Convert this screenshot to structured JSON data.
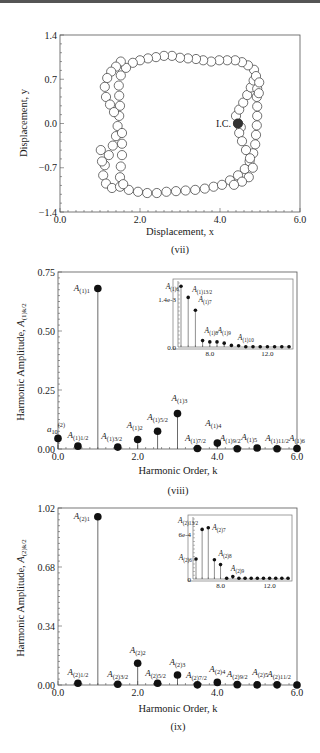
{
  "chart_data": [
    {
      "id": "vii",
      "type": "scatter",
      "title": "",
      "caption": "(vii)",
      "xlabel": "Displacement, x",
      "ylabel": "Displacement, y",
      "xlim": [
        0.0,
        6.0
      ],
      "ylim": [
        -1.4,
        1.4
      ],
      "xticks": [
        "0.0",
        "2.0",
        "4.0",
        "6.0"
      ],
      "yticks": [
        "1.4",
        "0.7",
        "0.0",
        "-0.7",
        "-1.4"
      ],
      "annotation": {
        "text": "I.C.",
        "x": 4.45,
        "y": 0.0
      },
      "initial_condition": {
        "x": 4.45,
        "y": 0.0
      },
      "trajectory": [
        [
          4.45,
          0.0
        ],
        [
          4.4,
          0.12
        ],
        [
          4.48,
          0.22
        ],
        [
          4.58,
          0.33
        ],
        [
          4.68,
          0.45
        ],
        [
          4.77,
          0.57
        ],
        [
          4.84,
          0.68
        ],
        [
          4.93,
          0.55
        ],
        [
          4.92,
          0.42
        ],
        [
          4.85,
          0.85
        ],
        [
          4.7,
          0.92
        ],
        [
          4.55,
          0.97
        ],
        [
          4.38,
          1.0
        ],
        [
          4.18,
          1.0
        ],
        [
          3.98,
          1.0
        ],
        [
          3.78,
          0.98
        ],
        [
          3.58,
          1.0
        ],
        [
          3.4,
          1.02
        ],
        [
          3.2,
          1.03
        ],
        [
          3.0,
          1.04
        ],
        [
          2.8,
          1.07
        ],
        [
          2.6,
          1.07
        ],
        [
          2.4,
          1.05
        ],
        [
          2.2,
          1.03
        ],
        [
          2.0,
          1.0
        ],
        [
          1.82,
          0.96
        ],
        [
          1.65,
          0.88
        ],
        [
          1.52,
          0.76
        ],
        [
          1.47,
          0.6
        ],
        [
          1.48,
          0.44
        ],
        [
          1.5,
          0.28
        ],
        [
          1.48,
          0.12
        ],
        [
          1.44,
          -0.04
        ],
        [
          1.4,
          -0.2
        ],
        [
          1.32,
          -0.35
        ],
        [
          1.22,
          -0.5
        ],
        [
          1.12,
          -0.66
        ],
        [
          1.08,
          -0.82
        ],
        [
          1.15,
          -0.95
        ],
        [
          1.3,
          -1.02
        ],
        [
          1.05,
          -0.6
        ],
        [
          1.02,
          -0.42
        ],
        [
          1.5,
          -1.0
        ],
        [
          1.72,
          -1.05
        ],
        [
          1.95,
          -1.08
        ],
        [
          2.18,
          -1.1
        ],
        [
          2.42,
          -1.1
        ],
        [
          2.66,
          -1.08
        ],
        [
          2.9,
          -1.07
        ],
        [
          3.14,
          -1.06
        ],
        [
          3.38,
          -1.05
        ],
        [
          3.62,
          -1.03
        ],
        [
          3.84,
          -1.0
        ],
        [
          4.05,
          -0.97
        ],
        [
          4.25,
          -0.9
        ],
        [
          4.45,
          -0.82
        ],
        [
          4.62,
          -0.72
        ],
        [
          4.74,
          -0.6
        ],
        [
          4.83,
          -0.47
        ],
        [
          4.88,
          -0.33
        ],
        [
          4.9,
          -0.18
        ],
        [
          4.92,
          -0.03
        ],
        [
          4.93,
          0.12
        ],
        [
          4.93,
          0.27
        ],
        [
          4.52,
          -0.06
        ],
        [
          4.48,
          -0.15
        ],
        [
          4.55,
          -0.28
        ],
        [
          4.65,
          -0.42
        ],
        [
          4.75,
          -0.55
        ],
        [
          4.82,
          -0.7
        ],
        [
          4.72,
          -0.85
        ],
        [
          4.55,
          -0.92
        ],
        [
          4.35,
          -0.97
        ],
        [
          1.52,
          0.98
        ],
        [
          1.4,
          0.9
        ],
        [
          1.28,
          0.82
        ],
        [
          1.18,
          0.72
        ],
        [
          1.12,
          0.58
        ],
        [
          1.15,
          0.42
        ],
        [
          1.25,
          0.3
        ],
        [
          1.35,
          0.18
        ],
        [
          1.55,
          -0.15
        ],
        [
          1.55,
          -0.32
        ],
        [
          1.55,
          -0.5
        ],
        [
          1.52,
          -0.68
        ],
        [
          1.5,
          -0.85
        ],
        [
          1.58,
          -0.96
        ],
        [
          4.9,
          0.75
        ],
        [
          4.98,
          0.65
        ],
        [
          4.97,
          0.48
        ]
      ]
    },
    {
      "id": "viii",
      "type": "bar",
      "subtype": "stem",
      "caption": "(viii)",
      "xlabel": "Harmonic Order, k",
      "ylabel": "Harmonic Amplitude, A(1)k/2",
      "xlim": [
        0.0,
        6.0
      ],
      "ylim": [
        0.0,
        0.75
      ],
      "xticks": [
        "0.0",
        "2.0",
        "4.0",
        "6.0"
      ],
      "yticks": [
        "0.75",
        "0.50",
        "0.25",
        "0.00"
      ],
      "points": [
        {
          "k": 0.0,
          "value": 0.045,
          "label": "a10(2)"
        },
        {
          "k": 0.5,
          "value": 0.012,
          "label": "A(1)1/2"
        },
        {
          "k": 1.0,
          "value": 0.68,
          "label": "A(1)1"
        },
        {
          "k": 1.5,
          "value": 0.008,
          "label": "A(1)3/2"
        },
        {
          "k": 2.0,
          "value": 0.04,
          "label": "A(1)2"
        },
        {
          "k": 2.5,
          "value": 0.075,
          "label": "A(1)5/2"
        },
        {
          "k": 3.0,
          "value": 0.15,
          "label": "A(1)3"
        },
        {
          "k": 3.5,
          "value": 0.002,
          "label": "A(1)7/2"
        },
        {
          "k": 4.0,
          "value": 0.025,
          "label": "A(1)4"
        },
        {
          "k": 4.5,
          "value": 0.001,
          "label": "A(1)9/2"
        },
        {
          "k": 5.0,
          "value": 0.004,
          "label": "A(1)5"
        },
        {
          "k": 5.5,
          "value": 0.001,
          "label": "A(1)11/2"
        },
        {
          "k": 6.0,
          "value": 0.002,
          "label": "A(1)6"
        }
      ],
      "inset": {
        "xlim": [
          6.0,
          13.5
        ],
        "ylim": [
          0.0,
          0.002
        ],
        "xticks": [
          "8.0",
          "12.0"
        ],
        "yticks": [
          "1.4e-3",
          "0.0"
        ],
        "points": [
          {
            "k": 6.0,
            "value": 0.0019,
            "label": "A(1)6"
          },
          {
            "k": 6.5,
            "value": 0.00155,
            "label": "A(1)13/2"
          },
          {
            "k": 7.0,
            "value": 0.00115,
            "label": "A(1)7"
          },
          {
            "k": 7.5,
            "value": 0.0002,
            "label": "A(1)8"
          },
          {
            "k": 8.0,
            "value": 0.00016,
            "label": ""
          },
          {
            "k": 8.5,
            "value": 0.00016,
            "label": ""
          },
          {
            "k": 9.0,
            "value": 0.00012,
            "label": "A(1)9"
          },
          {
            "k": 9.5,
            "value": 5e-05,
            "label": ""
          },
          {
            "k": 10.0,
            "value": 4e-05,
            "label": ""
          },
          {
            "k": 10.5,
            "value": 1e-05,
            "label": "A(1)10"
          },
          {
            "k": 11.0,
            "value": 1e-05,
            "label": ""
          },
          {
            "k": 11.5,
            "value": 1e-05,
            "label": ""
          },
          {
            "k": 12.0,
            "value": 1e-05,
            "label": ""
          },
          {
            "k": 12.5,
            "value": 1e-05,
            "label": ""
          },
          {
            "k": 13.0,
            "value": 1e-05,
            "label": ""
          },
          {
            "k": 13.5,
            "value": 1e-05,
            "label": ""
          }
        ]
      }
    },
    {
      "id": "ix",
      "type": "bar",
      "subtype": "stem",
      "caption": "(ix)",
      "xlabel": "Harmonic Order, k",
      "ylabel": "Harmonic Amplitude, A(2)k/2",
      "xlim": [
        0.0,
        6.0
      ],
      "ylim": [
        0.0,
        1.02
      ],
      "xticks": [
        "0.0",
        "2.0",
        "4.0",
        "6.0"
      ],
      "yticks": [
        "1.02",
        "0.68",
        "0.34",
        "0.00"
      ],
      "points": [
        {
          "k": 0.5,
          "value": 0.01,
          "label": "A(2)1/2"
        },
        {
          "k": 1.0,
          "value": 0.97,
          "label": "A(2)1"
        },
        {
          "k": 1.5,
          "value": 0.004,
          "label": "A(2)3/2"
        },
        {
          "k": 2.0,
          "value": 0.125,
          "label": "A(2)2"
        },
        {
          "k": 2.5,
          "value": 0.01,
          "label": "A(2)5/2"
        },
        {
          "k": 3.0,
          "value": 0.058,
          "label": "A(2)3"
        },
        {
          "k": 3.5,
          "value": 0.001,
          "label": "A(2)7/2"
        },
        {
          "k": 4.0,
          "value": 0.015,
          "label": "A(2)4"
        },
        {
          "k": 4.5,
          "value": 0.002,
          "label": "A(2)9/2"
        },
        {
          "k": 5.0,
          "value": 0.001,
          "label": "A(2)5"
        },
        {
          "k": 5.5,
          "value": 0.001,
          "label": "A(2)11/2"
        },
        {
          "k": 6.0,
          "value": 0.0003,
          "label": ""
        }
      ],
      "inset": {
        "xlim": [
          6.0,
          13.5
        ],
        "ylim": [
          0.0,
          0.00075
        ],
        "xticks": [
          "8.0",
          "12.0"
        ],
        "yticks": [
          "6e-4",
          "0"
        ],
        "points": [
          {
            "k": 6.0,
            "value": 0.00025,
            "label": "A(2)6"
          },
          {
            "k": 6.5,
            "value": 0.00062,
            "label": "A(2)13/2"
          },
          {
            "k": 7.0,
            "value": 0.00064,
            "label": "A(2)7"
          },
          {
            "k": 7.5,
            "value": 0.00024,
            "label": "A(2)8"
          },
          {
            "k": 8.0,
            "value": 0.00018,
            "label": ""
          },
          {
            "k": 8.5,
            "value": 1e-05,
            "label": ""
          },
          {
            "k": 9.0,
            "value": 3e-05,
            "label": "A(2)9"
          },
          {
            "k": 9.5,
            "value": 1e-05,
            "label": ""
          },
          {
            "k": 10.0,
            "value": 1e-05,
            "label": ""
          },
          {
            "k": 10.5,
            "value": 1e-05,
            "label": ""
          },
          {
            "k": 11.0,
            "value": 1e-05,
            "label": ""
          },
          {
            "k": 11.5,
            "value": 1e-05,
            "label": ""
          },
          {
            "k": 12.0,
            "value": 1e-05,
            "label": ""
          },
          {
            "k": 12.5,
            "value": 1e-05,
            "label": ""
          },
          {
            "k": 13.0,
            "value": 1e-05,
            "label": ""
          },
          {
            "k": 13.5,
            "value": 1e-05,
            "label": ""
          }
        ]
      }
    }
  ],
  "figure": {
    "caption_partial": "Figure 5.16 ..."
  }
}
